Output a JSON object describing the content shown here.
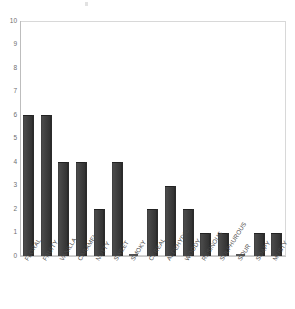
{
  "chart_data": {
    "type": "bar",
    "title": "",
    "subtitle": "",
    "xlabel": "",
    "ylabel": "",
    "ylim": [
      0,
      10
    ],
    "ytick_step": 1,
    "grid": false,
    "legend": false,
    "legend_position": "none",
    "orientation": "vertical",
    "bar_color": "#3f3f3f",
    "axis_color": "#c9c9c9",
    "tick_label_color": "#6e6e6e",
    "category_label_color": "#4a4a4a",
    "category_label_rotation": -58,
    "yticks": [
      "0",
      "1",
      "2",
      "3",
      "4",
      "5",
      "6",
      "7",
      "8",
      "9",
      "10"
    ],
    "categories": [
      "FLORAL",
      "FRUITY",
      "VANILLA",
      "CARAMEL",
      "NUTTY",
      "SWEET",
      "SMOKY",
      "CEREAL",
      "ALDEHYDIC",
      "WOODY",
      "RESINOUS",
      "SULPHUROUS",
      "SOUR",
      "SOAPY",
      "MUSTY"
    ],
    "values": [
      6,
      6,
      4,
      4,
      2,
      4,
      0,
      2,
      3,
      2,
      1,
      1,
      0,
      1,
      1
    ]
  }
}
